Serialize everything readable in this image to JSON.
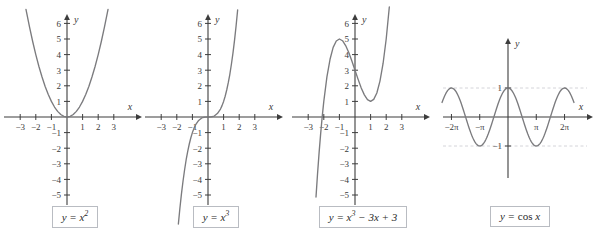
{
  "figure": {
    "background": "#ffffff",
    "curve_color": "#7b7b7e",
    "axis_color": "#3d3d3d",
    "grid_color": "#c9c9cf",
    "caption_border": "#b9bcc2"
  },
  "panels": [
    {
      "id": "panel-x-squared",
      "caption": "y = x2",
      "caption_base": "y = x",
      "caption_exp": "2",
      "chart_data": {
        "type": "line",
        "title": "y = x^2",
        "expression": "y = x^2",
        "xlabel": "x",
        "ylabel": "y",
        "xlim": [
          -3.6,
          3.6
        ],
        "ylim": [
          -5.6,
          6.9
        ],
        "xticks": [
          -3,
          -2,
          -1,
          1,
          2,
          3
        ],
        "xtick_labels": [
          "−3",
          "−2",
          "−1",
          "1",
          "2",
          "3"
        ],
        "yticks": [
          -5,
          -4,
          -3,
          -2,
          -1,
          1,
          2,
          3,
          4,
          5,
          6
        ],
        "ytick_labels": [
          "−5",
          "−4",
          "−3",
          "−2",
          "−1",
          "1",
          "2",
          "3",
          "4",
          "5",
          "6"
        ],
        "grid": false,
        "legend": "none",
        "series": [
          {
            "name": "y = x^2",
            "fn": "square",
            "x": [
              -2.63,
              -2.4,
              -2.2,
              -2.0,
              -1.8,
              -1.6,
              -1.4,
              -1.2,
              -1.0,
              -0.8,
              -0.6,
              -0.4,
              -0.2,
              0,
              0.2,
              0.4,
              0.6,
              0.8,
              1.0,
              1.2,
              1.4,
              1.6,
              1.8,
              2.0,
              2.2,
              2.4,
              2.63
            ],
            "values": [
              6.9,
              5.76,
              4.84,
              4.0,
              3.24,
              2.56,
              1.96,
              1.44,
              1.0,
              0.64,
              0.36,
              0.16,
              0.04,
              0,
              0.04,
              0.16,
              0.36,
              0.64,
              1.0,
              1.44,
              1.96,
              2.56,
              3.24,
              4.0,
              4.84,
              5.76,
              6.9
            ]
          }
        ]
      }
    },
    {
      "id": "panel-x-cubed",
      "caption": "y = x3",
      "caption_base": "y = x",
      "caption_exp": "3",
      "chart_data": {
        "type": "line",
        "title": "y = x^3",
        "expression": "y = x^3",
        "xlabel": "x",
        "ylabel": "y",
        "xlim": [
          -3.6,
          3.6
        ],
        "ylim": [
          -5.6,
          6.9
        ],
        "xticks": [
          -3,
          -2,
          -1,
          1,
          2,
          3
        ],
        "xtick_labels": [
          "−3",
          "−2",
          "−1",
          "1",
          "2",
          "3"
        ],
        "yticks": [
          -5,
          -4,
          -3,
          -2,
          -1,
          1,
          2,
          3,
          4,
          5,
          6
        ],
        "ytick_labels": [
          "−5",
          "−4",
          "−3",
          "−2",
          "−1",
          "1",
          "2",
          "3",
          "4",
          "5",
          "6"
        ],
        "grid": false,
        "legend": "none",
        "series": [
          {
            "name": "y = x^3",
            "fn": "cube",
            "x": [
              -1.9,
              -1.8,
              -1.7,
              -1.6,
              -1.5,
              -1.4,
              -1.3,
              -1.2,
              -1.1,
              -1.0,
              -0.9,
              -0.8,
              -0.6,
              -0.4,
              -0.2,
              0,
              0.2,
              0.4,
              0.6,
              0.8,
              0.9,
              1.0,
              1.1,
              1.2,
              1.3,
              1.4,
              1.5,
              1.6,
              1.7,
              1.8,
              1.9
            ],
            "values": [
              -6.86,
              -5.83,
              -4.91,
              -4.1,
              -3.38,
              -2.74,
              -2.2,
              -1.73,
              -1.33,
              -1.0,
              -0.73,
              -0.51,
              -0.22,
              -0.06,
              -0.01,
              0,
              0.01,
              0.06,
              0.22,
              0.51,
              0.73,
              1.0,
              1.33,
              1.73,
              2.2,
              2.74,
              3.38,
              4.1,
              4.91,
              5.83,
              6.86
            ]
          }
        ]
      }
    },
    {
      "id": "panel-cubic-poly",
      "caption": "y = x3 − 3x + 3",
      "caption_base": "y = x",
      "caption_exp": "3",
      "caption_tail": " − 3x + 3",
      "chart_data": {
        "type": "line",
        "title": "y = x^3 - 3x + 3",
        "expression": "y = x^3 − 3x + 3",
        "xlabel": "x",
        "ylabel": "y",
        "xlim": [
          -3.6,
          3.6
        ],
        "ylim": [
          -5.6,
          6.9
        ],
        "xticks": [
          -3,
          -2,
          -1,
          1,
          2,
          3
        ],
        "xtick_labels": [
          "−3",
          "−2",
          "−1",
          "1",
          "2",
          "3"
        ],
        "yticks": [
          -5,
          -4,
          -3,
          -2,
          -1,
          1,
          2,
          3,
          4,
          5,
          6
        ],
        "ytick_labels": [
          "−5",
          "−4",
          "−3",
          "−2",
          "−1",
          "1",
          "2",
          "3",
          "4",
          "5",
          "6"
        ],
        "grid": false,
        "legend": "none",
        "annotations": [
          {
            "label": "local maximum",
            "x": -1,
            "y": 5
          },
          {
            "label": "local minimum",
            "x": 1,
            "y": 1
          },
          {
            "label": "x-intercept",
            "x": -2.1,
            "y": 0
          }
        ],
        "series": [
          {
            "name": "y = x^3 - 3x + 3",
            "fn": "cubic_poly",
            "x": [
              -2.5,
              -2.4,
              -2.3,
              -2.2,
              -2.1,
              -2.0,
              -1.8,
              -1.6,
              -1.4,
              -1.2,
              -1.0,
              -0.8,
              -0.6,
              -0.4,
              -0.2,
              0,
              0.2,
              0.4,
              0.6,
              0.8,
              1.0,
              1.2,
              1.4,
              1.6,
              1.8,
              2.0,
              2.2
            ],
            "values": [
              -5.13,
              -3.62,
              -2.27,
              -1.05,
              0.04,
              1.0,
              2.57,
              3.7,
              4.46,
              4.87,
              5.0,
              4.89,
              4.58,
              4.14,
              3.59,
              3.0,
              2.41,
              1.86,
              1.42,
              1.11,
              1.0,
              1.13,
              1.54,
              2.3,
              3.43,
              5.0,
              7.05
            ]
          }
        ]
      }
    },
    {
      "id": "panel-cosine",
      "caption": "y = cos x",
      "caption_base": "y = ",
      "caption_rm": "cos",
      "caption_tail": " x",
      "chart_data": {
        "type": "line",
        "title": "y = cos x",
        "expression": "y = cos x",
        "xlabel": "x",
        "ylabel": "y",
        "xlim": [
          -7.6,
          7.9
        ],
        "ylim": [
          -1.9,
          2.5
        ],
        "xticks": [
          -6.2832,
          -3.1416,
          3.1416,
          6.2832
        ],
        "xtick_labels": [
          "−2π",
          "−π",
          "π",
          "2π"
        ],
        "yticks": [
          -1,
          1
        ],
        "ytick_labels": [
          "−1",
          "1"
        ],
        "grid": false,
        "gridlines_h": [
          1,
          -1
        ],
        "legend": "none",
        "series": [
          {
            "name": "y = cos x",
            "fn": "cos",
            "x_start": -7.33,
            "x_end": 7.33,
            "samples": 160
          }
        ]
      }
    }
  ]
}
